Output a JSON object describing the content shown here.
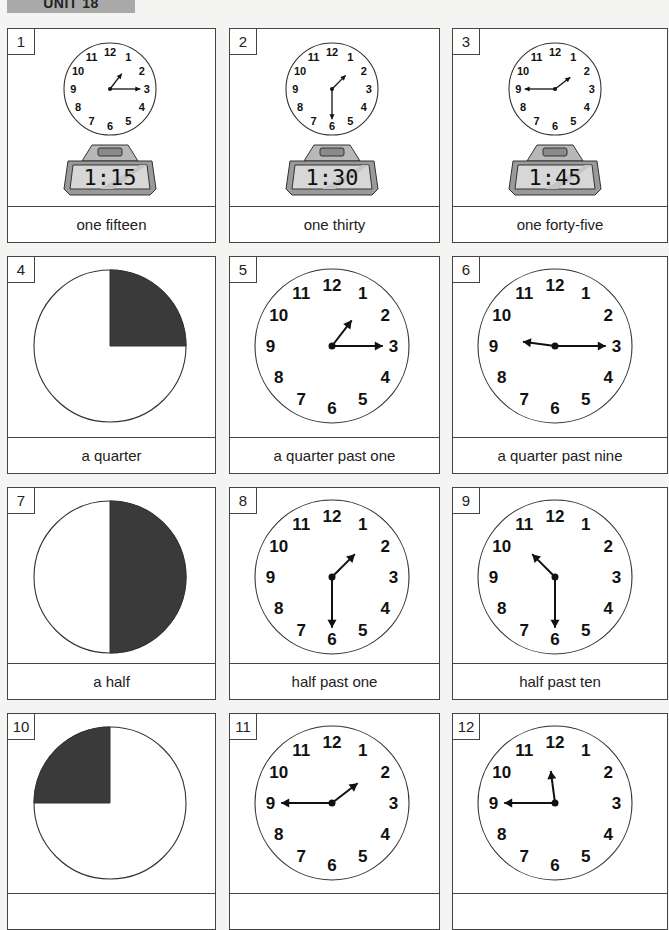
{
  "header": {
    "unit_label": "UNIT 18"
  },
  "cells": [
    {
      "number": "1",
      "type": "clock_digital",
      "hour": 1,
      "minute": 15,
      "digital": "1:15",
      "label": "one fifteen"
    },
    {
      "number": "2",
      "type": "clock_digital",
      "hour": 1,
      "minute": 30,
      "digital": "1:30",
      "label": "one thirty"
    },
    {
      "number": "3",
      "type": "clock_digital",
      "hour": 1,
      "minute": 45,
      "digital": "1:45",
      "label": "one forty-five"
    },
    {
      "number": "4",
      "type": "fraction",
      "fraction": "quarter-top-right",
      "label": "a quarter"
    },
    {
      "number": "5",
      "type": "clock",
      "hour": 1,
      "minute": 15,
      "label": "a quarter past one"
    },
    {
      "number": "6",
      "type": "clock",
      "hour": 9,
      "minute": 15,
      "label": "a quarter past nine"
    },
    {
      "number": "7",
      "type": "fraction",
      "fraction": "half-right",
      "label": "a half"
    },
    {
      "number": "8",
      "type": "clock",
      "hour": 1,
      "minute": 30,
      "label": "half past one"
    },
    {
      "number": "9",
      "type": "clock",
      "hour": 10,
      "minute": 30,
      "label": "half past ten"
    },
    {
      "number": "10",
      "type": "fraction",
      "fraction": "quarter-top-left",
      "label": ""
    },
    {
      "number": "11",
      "type": "clock",
      "hour": 1,
      "minute": 45,
      "label": ""
    },
    {
      "number": "12",
      "type": "clock",
      "hour": 11,
      "minute": 45,
      "label": ""
    }
  ],
  "clock_numerals": [
    "12",
    "1",
    "2",
    "3",
    "4",
    "5",
    "6",
    "7",
    "8",
    "9",
    "10",
    "11"
  ],
  "colors": {
    "shade": "#3a3a3a",
    "border": "#444444",
    "unit_bar": "#a9a9a9",
    "page": "#f4f4f2"
  }
}
